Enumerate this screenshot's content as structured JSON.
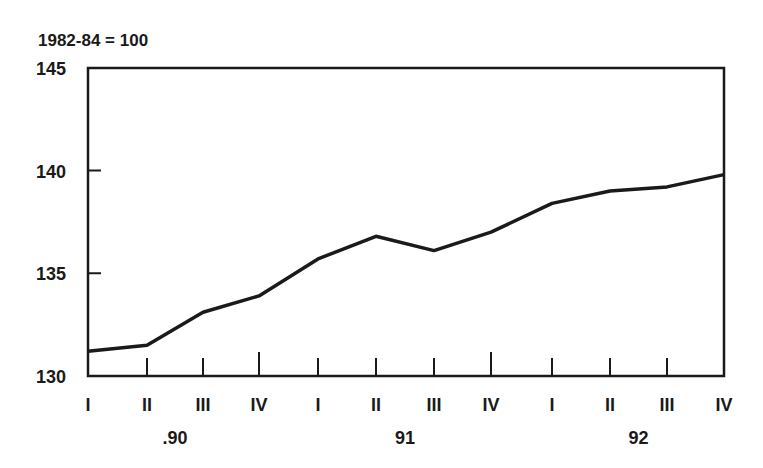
{
  "chart_data": {
    "type": "line",
    "title": "",
    "subtitle": "1982-84 = 100",
    "xlabel": "",
    "ylabel": "",
    "ylim": [
      130,
      145
    ],
    "yticks": [
      130,
      135,
      140,
      145
    ],
    "grid": false,
    "legend": null,
    "categories": [
      "I",
      "II",
      "III",
      "IV",
      "I",
      "II",
      "III",
      "IV",
      "I",
      "II",
      "III",
      "IV"
    ],
    "year_labels": [
      {
        "label": ".90",
        "quarter_index": 1.5
      },
      {
        "label": "91",
        "quarter_index": 5.5
      },
      {
        "label": "92",
        "quarter_index": 9.5
      }
    ],
    "series": [
      {
        "name": "Index",
        "values": [
          131.2,
          131.5,
          133.1,
          133.9,
          135.7,
          136.8,
          136.1,
          137.0,
          138.4,
          139.0,
          139.2,
          139.8
        ]
      }
    ]
  },
  "colors": {
    "line": "#1a1a1a",
    "axis": "#1a1a1a",
    "background": "#ffffff"
  }
}
